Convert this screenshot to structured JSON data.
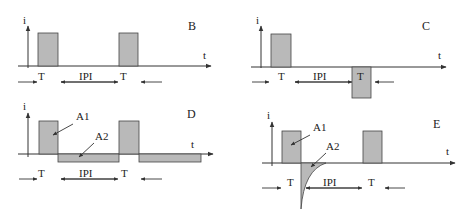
{
  "figure": {
    "colors": {
      "pulse_fill": "#b9b9b9",
      "line": "#333333",
      "background": "#ffffff"
    },
    "axis_labels": {
      "y": "i",
      "x": "t"
    },
    "panels": [
      {
        "id": "B",
        "label": "B",
        "description": "Monophasic pulses",
        "origin": [
          28,
          66
        ],
        "label_pos": [
          188,
          30
        ],
        "pulses": [
          {
            "x": 38,
            "w": 20,
            "y": 33,
            "h": 33
          },
          {
            "x": 119,
            "w": 19,
            "y": 33,
            "h": 33
          }
        ],
        "timing": {
          "y": 82,
          "T1": "T",
          "IPI": "IPI",
          "T2": "T",
          "x": [
            18,
            62,
            118,
            162
          ]
        }
      },
      {
        "id": "C",
        "label": "C",
        "description": "Biphasic pulses (second phase negative)",
        "origin": [
          261,
          66
        ],
        "label_pos": [
          424,
          30
        ],
        "pulses": [
          {
            "x": 271,
            "w": 20,
            "y": 33,
            "h": 33
          },
          {
            "x": 352,
            "w": 19,
            "y": 66,
            "h": 32
          }
        ],
        "timing": {
          "y": 82,
          "T1": "T",
          "IPI": "IPI",
          "T2": "T",
          "x": [
            252,
            294,
            353,
            394
          ]
        }
      },
      {
        "id": "D",
        "label": "D",
        "description": "Charge-balanced pulses with long low-amplitude return phase",
        "areas": [
          "A1",
          "A2"
        ],
        "origin": [
          28,
          154
        ],
        "label_pos": [
          188,
          117
        ]
      },
      {
        "id": "E",
        "label": "E",
        "description": "Pulses with exponential passive discharge",
        "areas": [
          "A1",
          "A2"
        ],
        "origin": [
          272,
          163
        ],
        "label_pos": [
          436,
          126
        ]
      }
    ],
    "timing_labels": {
      "T": "T",
      "IPI": "IPI"
    },
    "annotations": {
      "A1": "A1",
      "A2": "A2"
    }
  }
}
